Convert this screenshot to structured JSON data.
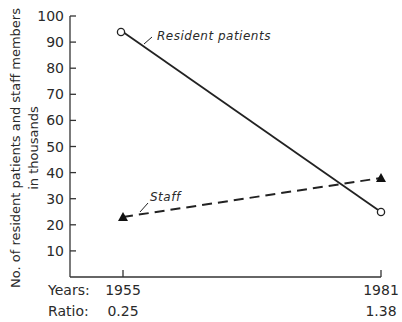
{
  "chart_data": {
    "type": "line",
    "title": "",
    "xlabel": "Years",
    "ylabel": "No. of resident patients and staff members in thousands",
    "ylabel_lines": [
      "No. of resident patients and staff members",
      "in thousands"
    ],
    "x": [
      "1955",
      "1981"
    ],
    "ylim": [
      0,
      100
    ],
    "yticks": [
      "10",
      "20",
      "30",
      "40",
      "50",
      "60",
      "70",
      "80",
      "90",
      "100"
    ],
    "grid": false,
    "series": [
      {
        "name": "Resident patients",
        "values": [
          93,
          25
        ],
        "style": "solid",
        "marker": "open-circle"
      },
      {
        "name": "Staff",
        "values": [
          23,
          38
        ],
        "style": "dashed",
        "marker": "filled-triangle"
      }
    ],
    "bottom_rows": [
      {
        "label": "Years:",
        "values": [
          "1955",
          "1981"
        ]
      },
      {
        "label": "Ratio:",
        "values": [
          "0.25",
          "1.38"
        ]
      }
    ],
    "annotations": [
      "Resident patients",
      "Staff"
    ]
  }
}
